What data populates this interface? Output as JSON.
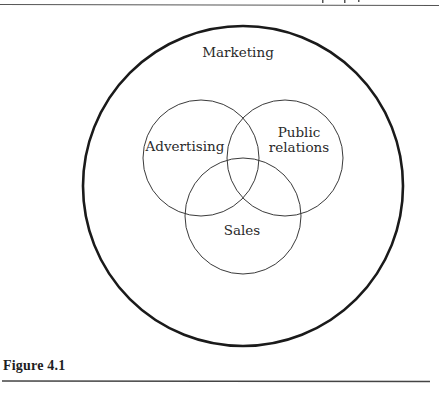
{
  "diagram": {
    "type": "nested-venn",
    "outer": {
      "label": "Marketing",
      "cx": 243,
      "cy": 186,
      "r": 160
    },
    "circles": [
      {
        "id": "advertising",
        "label_lines": [
          "Advertising"
        ],
        "cx": 201,
        "cy": 158,
        "r": 58
      },
      {
        "id": "public-relations",
        "label_lines": [
          "Public",
          "relations"
        ],
        "cx": 285,
        "cy": 158,
        "r": 58
      },
      {
        "id": "sales",
        "label_lines": [
          "Sales"
        ],
        "cx": 243,
        "cy": 216,
        "r": 58
      }
    ]
  },
  "labels": {
    "outer": "Marketing",
    "advertising": "Advertising",
    "public_line1": "Public",
    "public_line2": "relations",
    "sales": "Sales"
  },
  "caption": "Figure 4.1",
  "colors": {
    "outer_stroke": "#1a1a1a",
    "inner_stroke": "#3a3a3a",
    "text": "#2a2a2a",
    "rule": "#444444"
  }
}
